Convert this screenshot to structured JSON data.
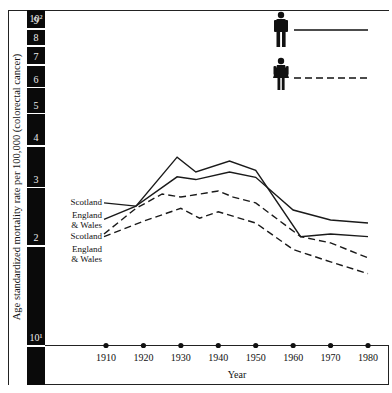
{
  "chart_data": {
    "type": "line",
    "title": "",
    "ylabel": "Age standardized mortality rate per 100,000 (colorectal cancer)",
    "xlabel": "Year",
    "yscale": "log",
    "ylim": [
      10,
      100
    ],
    "y_tick_labels": [
      "10¹",
      "2",
      "3",
      "4",
      "5",
      "6",
      "7",
      "8",
      "9",
      "10²"
    ],
    "y_tick_values": [
      10,
      20,
      30,
      40,
      50,
      60,
      70,
      80,
      90,
      100
    ],
    "x": [
      1910,
      1920,
      1930,
      1940,
      1950,
      1960,
      1970,
      1980
    ],
    "x_tick_labels": [
      "1910",
      "1920",
      "1930",
      "1940",
      "1950",
      "1960",
      "1970",
      "1980"
    ],
    "grid": false,
    "legend": {
      "position": "top-right",
      "entries": [
        {
          "icon": "male-figure-icon",
          "style": "solid",
          "meaning": "Males"
        },
        {
          "icon": "female-figure-icon",
          "style": "dashed",
          "meaning": "Females"
        }
      ]
    },
    "series": [
      {
        "name": "Scotland (male)",
        "style": "solid",
        "label": "Scotland",
        "x": [
          1910,
          1918,
          1929,
          1934,
          1943,
          1950,
          1960,
          1970,
          1980
        ],
        "values": [
          26.8,
          26.2,
          32.1,
          31.5,
          33.2,
          32.0,
          25.5,
          23.8,
          23.3
        ]
      },
      {
        "name": "England & Wales (male)",
        "style": "solid",
        "label": "England & Wales",
        "x": [
          1910,
          1918,
          1929,
          1934,
          1943,
          1950,
          1962,
          1970,
          1980
        ],
        "values": [
          23.9,
          26.2,
          36.8,
          33.2,
          35.8,
          33.6,
          21.2,
          21.6,
          21.2
        ]
      },
      {
        "name": "Scotland (female)",
        "style": "dashed",
        "label": "Scotland",
        "x": [
          1910,
          1918,
          1925,
          1930,
          1940,
          1944,
          1950,
          1962,
          1970,
          1980
        ],
        "values": [
          21.6,
          25.8,
          28.5,
          27.9,
          29.1,
          27.9,
          26.8,
          21.2,
          20.3,
          18.3
        ]
      },
      {
        "name": "England & Wales (female)",
        "style": "dashed",
        "label": "England & Wales",
        "x": [
          1910,
          1920,
          1930,
          1935,
          1940,
          1950,
          1960,
          1970,
          1980
        ],
        "values": [
          21.2,
          23.6,
          25.8,
          24.1,
          25.2,
          23.3,
          19.4,
          17.8,
          16.4
        ]
      }
    ]
  },
  "labels": {
    "scotland_male": "Scotland",
    "england_male_1": "England",
    "england_male_2": "& Wales",
    "scotland_female": "Scotland",
    "england_female_1": "England",
    "england_female_2": "& Wales"
  }
}
